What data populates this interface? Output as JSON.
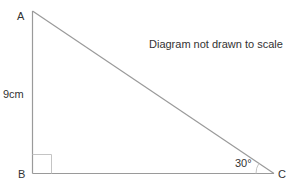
{
  "diagram": {
    "type": "right-triangle",
    "note": "Diagram not drawn to scale",
    "vertices": {
      "A": {
        "label": "A"
      },
      "B": {
        "label": "B"
      },
      "C": {
        "label": "C"
      }
    },
    "side_AB_label": "9cm",
    "angle_C_label": "30°",
    "right_angle_at": "B",
    "colors": {
      "stroke": "#9a9a9a",
      "text": "#333333"
    }
  }
}
